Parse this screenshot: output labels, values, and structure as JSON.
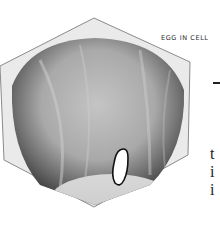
{
  "figure": {
    "caption": "EGG IN CELL",
    "icon": "egg-in-cell-illustration"
  },
  "right_column": {
    "heading_fragment": "-",
    "text_fragments": [
      "t",
      "i",
      "i"
    ]
  },
  "colors": {
    "background": "#ffffff",
    "cell_rim": "#e8e8e8",
    "cell_outline": "#8a8a8a",
    "cell_interior": "#b5b5b5",
    "cell_shadow": "#4a4a4a",
    "egg_fill": "#ffffff",
    "egg_outline": "#111111",
    "text": "#222222"
  }
}
